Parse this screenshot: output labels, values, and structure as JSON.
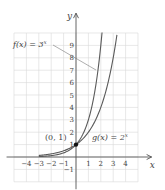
{
  "chart_data": {
    "type": "line",
    "title": "",
    "xlabel": "x",
    "ylabel": "y",
    "xlim": [
      -5,
      5
    ],
    "ylim": [
      -2,
      10
    ],
    "grid": true,
    "x_ticks": [
      -4,
      -3,
      -2,
      -1,
      1,
      2,
      3,
      4
    ],
    "x_tick_labels": [
      "−4",
      "−3",
      "−2",
      "−1",
      "1",
      "2",
      "3",
      "4"
    ],
    "y_ticks": [
      -1,
      1,
      2,
      3,
      4,
      5,
      6,
      7,
      8,
      9
    ],
    "y_tick_labels": [
      "−1",
      "1",
      "2",
      "3",
      "4",
      "5",
      "6",
      "7",
      "8",
      "9"
    ],
    "series": [
      {
        "name": "f(x) = 3^x",
        "label": "f(x) = 3",
        "label_exponent": "x",
        "x": [
          -3,
          -2,
          -1,
          0,
          1,
          1.5,
          2,
          2.1
        ],
        "values": [
          0.037,
          0.111,
          0.333,
          1,
          3,
          5.196,
          9,
          10.05
        ]
      },
      {
        "name": "g(x) = 2^x",
        "label": "g(x) = 2",
        "label_exponent": "x",
        "x": [
          -3,
          -2,
          -1,
          0,
          1,
          2,
          3,
          3.32
        ],
        "values": [
          0.125,
          0.25,
          0.5,
          1,
          2,
          4,
          8,
          10
        ]
      }
    ],
    "annotations": [
      {
        "text": "(0, 1)",
        "x": 0,
        "y": 1,
        "marker": "point"
      }
    ]
  }
}
